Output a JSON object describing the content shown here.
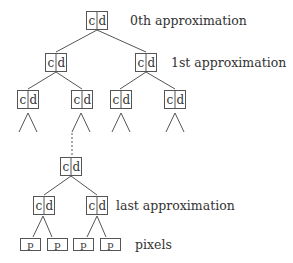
{
  "diagram": {
    "node": {
      "left": "c",
      "right": "d"
    },
    "pixel": "p",
    "labels": {
      "level0": "0th approximation",
      "level1": "1st approximation",
      "last": "last approximation",
      "pixels": "pixels"
    }
  }
}
